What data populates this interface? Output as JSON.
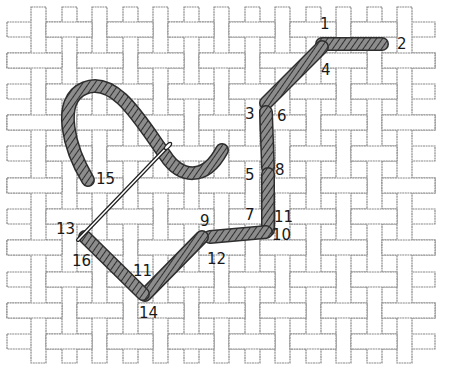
{
  "diagram": {
    "canvas": {
      "columns_x": [
        31,
        62,
        92,
        123,
        153,
        184,
        214,
        245,
        275,
        306,
        336,
        367,
        397
      ],
      "rows_y": [
        22,
        53,
        84,
        115,
        146,
        178,
        209,
        240,
        272,
        303,
        334
      ],
      "thread_width": 15,
      "h_thread_span": [
        7,
        435
      ],
      "v_thread_span": [
        7,
        363
      ],
      "thread_fill": "#ffffff",
      "thread_outline": "#8a8a8a"
    },
    "stitch_color": "#7a7a7a",
    "stitch_hatch_color": "#2e2e2e",
    "stitches": [
      {
        "from": "1",
        "to": "2",
        "x1": 322,
        "y1": 44,
        "x2": 382,
        "y2": 44
      },
      {
        "from": "4",
        "to": "3",
        "x1": 322,
        "y1": 47,
        "x2": 266,
        "y2": 103
      },
      {
        "from": "3",
        "to": "6",
        "x1": 266,
        "y1": 112,
        "x2": 268,
        "y2": 168
      },
      {
        "from": "5",
        "to": "8",
        "x1": 268,
        "y1": 174,
        "x2": 268,
        "y2": 230
      },
      {
        "from": "7",
        "to": "10",
        "x1": 266,
        "y1": 232,
        "x2": 210,
        "y2": 237
      },
      {
        "from": "9",
        "to": "12",
        "x1": 202,
        "y1": 237,
        "x2": 145,
        "y2": 295
      },
      {
        "from": "11",
        "to": "14",
        "x1": 143,
        "y1": 294,
        "x2": 85,
        "y2": 237
      }
    ],
    "loose_thread_path": "M88 180 C 70 150, 55 100, 85 88 C 115 76, 140 120, 165 155 C 180 178, 205 182, 222 150",
    "needle": {
      "eye_x": 170,
      "eye_y": 144,
      "tip_x": 78,
      "tip_y": 240
    },
    "labels": [
      {
        "text": "1",
        "x": 320,
        "y": 29
      },
      {
        "text": "2",
        "x": 397,
        "y": 49
      },
      {
        "text": "3",
        "x": 245,
        "y": 119
      },
      {
        "text": "4",
        "x": 321,
        "y": 75
      },
      {
        "text": "5",
        "x": 245,
        "y": 180
      },
      {
        "text": "6",
        "x": 277,
        "y": 121
      },
      {
        "text": "7",
        "x": 245,
        "y": 220
      },
      {
        "text": "8",
        "x": 275,
        "y": 175
      },
      {
        "text": "9",
        "x": 200,
        "y": 226
      },
      {
        "text": "10",
        "x": 272,
        "y": 240
      },
      {
        "text": "11",
        "x": 274,
        "y": 222
      },
      {
        "text": "12",
        "x": 207,
        "y": 264
      },
      {
        "text": "11",
        "x": 133,
        "y": 276
      },
      {
        "text": "13",
        "x": 56,
        "y": 234
      },
      {
        "text": "14",
        "x": 139,
        "y": 318
      },
      {
        "text": "15",
        "x": 96,
        "y": 184
      },
      {
        "text": "16",
        "x": 72,
        "y": 266
      }
    ]
  }
}
